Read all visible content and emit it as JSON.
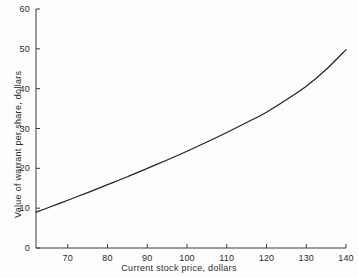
{
  "chart_data": {
    "type": "line",
    "title": "",
    "xlabel": "Current stock price, dollars",
    "ylabel": "Value of warrant per share, dollars",
    "xlim": [
      62,
      140
    ],
    "ylim": [
      0,
      60
    ],
    "grid": false,
    "legend": null,
    "xticks": [
      70,
      80,
      90,
      100,
      110,
      120,
      130,
      140
    ],
    "xtick_labels": [
      "70",
      "80",
      "90",
      "100",
      "110",
      "120",
      "130",
      "140"
    ],
    "yticks": [
      0,
      10,
      20,
      30,
      40,
      50,
      60
    ],
    "ytick_labels": [
      "0",
      "10",
      "20",
      "30",
      "40",
      "50",
      "60"
    ],
    "series": [
      {
        "name": "Warrant value",
        "color": "#222222",
        "x": [
          62,
          65,
          70,
          75,
          80,
          85,
          90,
          95,
          100,
          105,
          110,
          115,
          120,
          125,
          130,
          135,
          140
        ],
        "y": [
          9.0,
          10.1,
          12.0,
          13.9,
          15.9,
          17.9,
          20.0,
          22.1,
          24.3,
          26.6,
          29.0,
          31.5,
          34.1,
          37.2,
          40.6,
          44.8,
          49.8
        ]
      }
    ]
  },
  "axis_style": {
    "line_color": "#3a3a3a",
    "tick_direction": "in",
    "tick_length_px": 4
  }
}
